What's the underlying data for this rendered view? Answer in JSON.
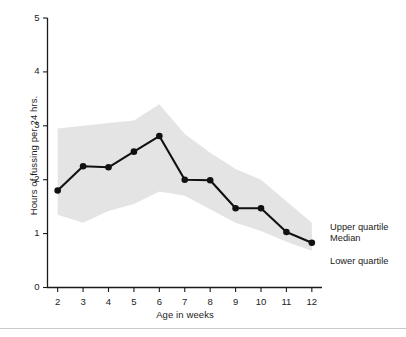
{
  "chart_data": {
    "type": "line",
    "title": "",
    "xlabel": "Age in weeks",
    "ylabel": "Hours of fussing per 24 hrs.",
    "xlim": [
      1.6,
      12.4
    ],
    "ylim": [
      0,
      5
    ],
    "x": [
      2,
      3,
      4,
      5,
      6,
      7,
      8,
      9,
      10,
      11,
      12
    ],
    "xticks": [
      "2",
      "3",
      "4",
      "5",
      "6",
      "7",
      "8",
      "9",
      "10",
      "11",
      "12"
    ],
    "yticks": [
      "0",
      "1",
      "2",
      "3",
      "4",
      "5"
    ],
    "grid": false,
    "legend_position": "right-inline",
    "series": [
      {
        "name": "Upper quartile",
        "type": "band-upper",
        "values": [
          2.95,
          3.0,
          3.05,
          3.1,
          3.4,
          2.85,
          2.5,
          2.2,
          2.0,
          1.6,
          1.2
        ]
      },
      {
        "name": "Median",
        "type": "line",
        "marker": "circle",
        "color": "#111111",
        "values": [
          1.8,
          2.25,
          2.23,
          2.52,
          2.81,
          2.0,
          1.99,
          1.47,
          1.47,
          1.03,
          0.83
        ]
      },
      {
        "name": "Lower quartile",
        "type": "band-lower",
        "values": [
          1.35,
          1.2,
          1.42,
          1.55,
          1.78,
          1.7,
          1.45,
          1.2,
          1.05,
          0.85,
          0.68
        ]
      }
    ],
    "band_color": "#e4e4e4",
    "annotations": [
      {
        "name": "upper-quartile-label",
        "text": "Upper quartile",
        "x": 330,
        "y": 222
      },
      {
        "name": "median-label",
        "text": "Median",
        "x": 330,
        "y": 233
      },
      {
        "name": "lower-quartile-label",
        "text": "Lower quartile",
        "x": 330,
        "y": 256
      }
    ]
  },
  "axes": {
    "x_title": "Age in weeks",
    "y_title": "Hours of fussing per 24 hrs."
  },
  "legend": {
    "upper": "Upper quartile",
    "median": "Median",
    "lower": "Lower quartile"
  }
}
